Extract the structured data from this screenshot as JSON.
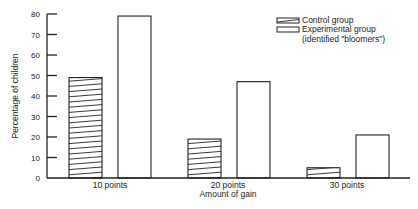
{
  "chart_data": {
    "type": "bar",
    "title": "",
    "xlabel": "Amount of gain",
    "ylabel": "Percentage of children",
    "categories": [
      "10 points",
      "20 points",
      "30 points"
    ],
    "series": [
      {
        "name": "Control group",
        "values": [
          49,
          19,
          5
        ],
        "pattern": "hatched"
      },
      {
        "name": "Experimental group (identified \"bloomers\")",
        "values": [
          79,
          47,
          21
        ],
        "pattern": "plain"
      }
    ],
    "ylim": [
      0,
      80
    ],
    "yticks": [
      0,
      10,
      20,
      30,
      40,
      50,
      60,
      70,
      80
    ],
    "grid": false,
    "legend_position": "top-right"
  },
  "legend": {
    "items": [
      {
        "label": "Control group"
      },
      {
        "label": "Experimental group"
      },
      {
        "label": "(identified \"bloomers\")"
      }
    ]
  },
  "colors": {
    "ink": "#222222",
    "background": "#ffffff"
  }
}
